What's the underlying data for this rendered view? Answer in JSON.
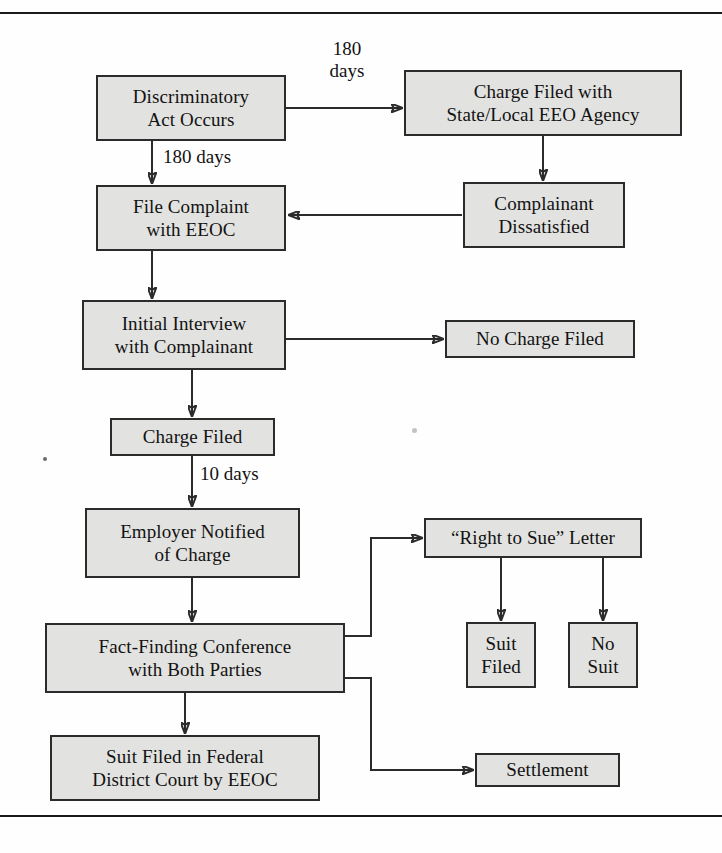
{
  "figure": {
    "kind": "flowchart",
    "box_fill": "#e2e2e0",
    "box_border": "#2b2b2b",
    "line_color": "#2b2b2b",
    "background": "#fefefe"
  },
  "nodes": [
    {
      "id": "discriminatory-act",
      "label": "Discriminatory\nAct Occurs",
      "x": 96,
      "y": 75,
      "w": 190,
      "h": 66
    },
    {
      "id": "charge-state-agency",
      "label": "Charge Filed with\nState/Local EEO Agency",
      "x": 404,
      "y": 70,
      "w": 278,
      "h": 66
    },
    {
      "id": "complainant-dissat",
      "label": "Complainant\nDissatisfied",
      "x": 463,
      "y": 182,
      "w": 162,
      "h": 66
    },
    {
      "id": "file-complaint-eeoc",
      "label": "File Complaint\nwith EEOC",
      "x": 96,
      "y": 185,
      "w": 190,
      "h": 66
    },
    {
      "id": "initial-interview",
      "label": "Initial Interview\nwith Complainant",
      "x": 82,
      "y": 300,
      "w": 204,
      "h": 70
    },
    {
      "id": "no-charge-filed",
      "label": "No Charge Filed",
      "x": 445,
      "y": 320,
      "w": 190,
      "h": 38
    },
    {
      "id": "charge-filed",
      "label": "Charge Filed",
      "x": 110,
      "y": 418,
      "w": 165,
      "h": 38
    },
    {
      "id": "employer-notified",
      "label": "Employer Notified\nof Charge",
      "x": 85,
      "y": 508,
      "w": 215,
      "h": 70
    },
    {
      "id": "right-to-sue-letter",
      "label": "“Right to Sue” Letter",
      "x": 424,
      "y": 518,
      "w": 218,
      "h": 40
    },
    {
      "id": "suit-filed-branch",
      "label": "Suit\nFiled",
      "x": 466,
      "y": 622,
      "w": 70,
      "h": 66
    },
    {
      "id": "no-suit-branch",
      "label": "No\nSuit",
      "x": 568,
      "y": 622,
      "w": 70,
      "h": 66
    },
    {
      "id": "fact-finding",
      "label": "Fact-Finding Conference\nwith Both Parties",
      "x": 45,
      "y": 623,
      "w": 300,
      "h": 70
    },
    {
      "id": "suit-federal-court",
      "label": "Suit Filed in Federal\nDistrict Court by EEOC",
      "x": 50,
      "y": 735,
      "w": 270,
      "h": 66
    },
    {
      "id": "settlement",
      "label": "Settlement",
      "x": 475,
      "y": 753,
      "w": 145,
      "h": 34
    }
  ],
  "edge_labels": [
    {
      "id": "label-180-days-state",
      "text": "180\ndays",
      "x": 312,
      "y": 38
    },
    {
      "id": "label-180-days-eeoc",
      "text": "180 days",
      "x": 175,
      "y": 146
    },
    {
      "id": "label-10-days",
      "text": "10 days",
      "x": 175,
      "y": 467
    }
  ],
  "edges": [
    {
      "id": "act-to-state-agency",
      "from": "discriminatory-act",
      "to": "charge-state-agency",
      "type": "straight-right",
      "label": "180 days"
    },
    {
      "id": "act-to-file-complaint",
      "from": "discriminatory-act",
      "to": "file-complaint-eeoc",
      "type": "straight-down",
      "label": "180 days"
    },
    {
      "id": "state-agency-to-dissat",
      "from": "charge-state-agency",
      "to": "complainant-dissat",
      "type": "straight-down",
      "label": ""
    },
    {
      "id": "dissat-to-file-complaint",
      "from": "complainant-dissat",
      "to": "file-complaint-eeoc",
      "type": "straight-left",
      "label": ""
    },
    {
      "id": "complaint-to-interview",
      "from": "file-complaint-eeoc",
      "to": "initial-interview",
      "type": "straight-down",
      "label": ""
    },
    {
      "id": "interview-to-no-charge",
      "from": "initial-interview",
      "to": "no-charge-filed",
      "type": "straight-right",
      "label": ""
    },
    {
      "id": "interview-to-charge-filed",
      "from": "initial-interview",
      "to": "charge-filed",
      "type": "straight-down",
      "label": ""
    },
    {
      "id": "charge-to-employer",
      "from": "charge-filed",
      "to": "employer-notified",
      "type": "straight-down",
      "label": "10 days"
    },
    {
      "id": "employer-to-fact-finding",
      "from": "employer-notified",
      "to": "fact-finding",
      "type": "straight-down",
      "label": ""
    },
    {
      "id": "fact-finding-to-rts",
      "from": "fact-finding",
      "to": "right-to-sue-letter",
      "type": "elbow-up",
      "label": ""
    },
    {
      "id": "fact-finding-to-settlement",
      "from": "fact-finding",
      "to": "settlement",
      "type": "elbow-down",
      "label": ""
    },
    {
      "id": "fact-finding-to-suit-court",
      "from": "fact-finding",
      "to": "suit-federal-court",
      "type": "straight-down",
      "label": ""
    },
    {
      "id": "rts-to-suit-filed",
      "from": "right-to-sue-letter",
      "to": "suit-filed-branch",
      "type": "straight-down",
      "label": ""
    },
    {
      "id": "rts-to-no-suit",
      "from": "right-to-sue-letter",
      "to": "no-suit-branch",
      "type": "straight-down",
      "label": ""
    }
  ]
}
